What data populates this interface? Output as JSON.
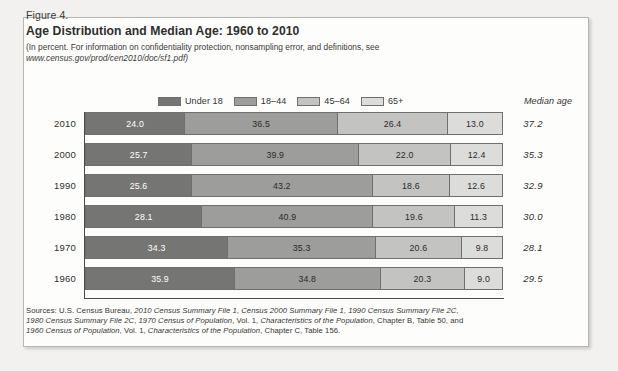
{
  "figure": {
    "number": "Figure 4.",
    "title": "Age Distribution and Median Age: 1960 to 2010",
    "subtitle_line1": "(In percent. For information on confidentiality protection, nonsampling error, and definitions, see",
    "subtitle_line2": "www.census.gov/prod/cen2010/doc/sf1.pdf)",
    "median_age_header": "Median age"
  },
  "colors": {
    "under_18": "#757573",
    "age_18_44": "#9d9d9b",
    "age_45_64": "#c3c3c1",
    "age_65_plus": "#dcdcda",
    "axis": "#4a4a48",
    "figure_border": "#b9b7b4",
    "page_background": "#f2f1ef",
    "figure_background": "#fdfdfc"
  },
  "sources": {
    "line1_plain1": "Sources: U.S. Census Bureau, ",
    "line1_italic1": "2010 Census Summary File 1",
    "line1_plain2": ", ",
    "line1_italic2": "Census 2000 Summary File 1",
    "line1_plain3": ", ",
    "line1_italic3": "1990 Census Summary File 2C",
    "line1_plain4": ",",
    "line2_italic1": "1980 Census Summary File 2C",
    "line2_plain1": ", ",
    "line2_italic2": "1970 Census of Population",
    "line2_plain2": ", Vol. 1, ",
    "line2_italic3": "Characteristics of the Population",
    "line2_plain3": ", Chapter B, Table 50, and",
    "line3_italic1": "1960 Census of Population",
    "line3_plain1": ", Vol. 1, ",
    "line3_italic2": "Characteristics of the Population",
    "line3_plain2": ", Chapter C, Table 156."
  },
  "chart_data": {
    "type": "bar",
    "title": "Age Distribution and Median Age: 1960 to 2010",
    "subtitle": "(In percent. For information on confidentiality protection, nonsampling error, and definitions, see www.census.gov/prod/cen2010/doc/sf1.pdf)",
    "orientation": "horizontal",
    "stacked": true,
    "stack_total": 100,
    "xlabel": "",
    "ylabel": "",
    "xlim": [
      0,
      100
    ],
    "grid": false,
    "legend_position": "top",
    "categories": [
      "2010",
      "2000",
      "1990",
      "1980",
      "1970",
      "1960"
    ],
    "series": [
      {
        "name": "Under 18",
        "color": "#757573",
        "values": [
          24.0,
          25.7,
          25.6,
          28.1,
          34.3,
          35.9
        ]
      },
      {
        "name": "18–44",
        "color": "#9d9d9b",
        "values": [
          36.5,
          39.9,
          43.2,
          40.9,
          35.3,
          34.8
        ]
      },
      {
        "name": "45–64",
        "color": "#c3c3c1",
        "values": [
          26.4,
          22.0,
          18.6,
          19.6,
          20.6,
          20.3
        ]
      },
      {
        "name": "65+",
        "color": "#dcdcda",
        "values": [
          13.0,
          12.4,
          12.6,
          11.3,
          9.8,
          9.0
        ]
      }
    ],
    "annotations": {
      "median_age_label": "Median age",
      "median_age_values": [
        "37.2",
        "35.3",
        "32.9",
        "30.0",
        "28.1",
        "29.5"
      ]
    },
    "rows": [
      {
        "year": "2010",
        "segments": [
          "24.0",
          "36.5",
          "26.4",
          "13.0"
        ],
        "median_age": "37.2"
      },
      {
        "year": "2000",
        "segments": [
          "25.7",
          "39.9",
          "22.0",
          "12.4"
        ],
        "median_age": "35.3"
      },
      {
        "year": "1990",
        "segments": [
          "25.6",
          "43.2",
          "18.6",
          "12.6"
        ],
        "median_age": "32.9"
      },
      {
        "year": "1980",
        "segments": [
          "28.1",
          "40.9",
          "19.6",
          "11.3"
        ],
        "median_age": "30.0"
      },
      {
        "year": "1970",
        "segments": [
          "34.3",
          "35.3",
          "20.6",
          "9.8"
        ],
        "median_age": "28.1"
      },
      {
        "year": "1960",
        "segments": [
          "35.9",
          "34.8",
          "20.3",
          "9.0"
        ],
        "median_age": "29.5"
      }
    ],
    "legend": [
      {
        "label": "Under 18",
        "color": "#757573"
      },
      {
        "label": "18–44",
        "color": "#9d9d9b"
      },
      {
        "label": "45–64",
        "color": "#c3c3c1"
      },
      {
        "label": "65+",
        "color": "#dcdcda"
      }
    ]
  }
}
